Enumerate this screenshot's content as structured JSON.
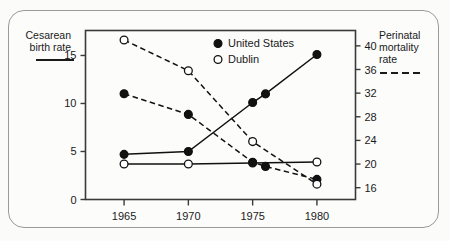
{
  "chart_data": {
    "type": "line",
    "title": "",
    "subtitle": "",
    "x": [
      1965,
      1970,
      1975,
      1976,
      1980
    ],
    "xlabel": "",
    "xtick_labels": [
      "1965",
      "1970",
      "1975",
      "1980"
    ],
    "xticks": [
      1965,
      1970,
      1975,
      1980
    ],
    "xlim": [
      1962,
      1983
    ],
    "left_axis": {
      "label": "Cesarean birth rate",
      "tick_labels": [
        "15",
        "10",
        "5",
        "0"
      ],
      "ticks": [
        15,
        10,
        5,
        0
      ],
      "ylim": [
        0,
        17.6
      ],
      "line_style": "solid"
    },
    "right_axis": {
      "label": "Perinatal mortality rate",
      "tick_labels": [
        "40",
        "36",
        "32",
        "28",
        "24",
        "20",
        "16"
      ],
      "ticks": [
        40,
        36,
        32,
        28,
        24,
        20,
        16
      ],
      "ylim": [
        14,
        42.6
      ],
      "line_style": "dashed"
    },
    "grid": false,
    "legend_position": "top-center",
    "legend": [
      {
        "name": "United States",
        "marker": "filled-circle"
      },
      {
        "name": "Dublin",
        "marker": "open-circle"
      }
    ],
    "series": [
      {
        "name": "United States cesarean birth rate",
        "axis": "left",
        "marker": "filled-circle",
        "line_style": "solid",
        "points": [
          {
            "x": 1965,
            "y": 4.7
          },
          {
            "x": 1970,
            "y": 5.0
          },
          {
            "x": 1975,
            "y": 10.1
          },
          {
            "x": 1976,
            "y": 11.0
          },
          {
            "x": 1980,
            "y": 15.1
          }
        ]
      },
      {
        "name": "Dublin cesarean birth rate",
        "axis": "left",
        "marker": "open-circle",
        "line_style": "solid",
        "points": [
          {
            "x": 1965,
            "y": 3.7
          },
          {
            "x": 1970,
            "y": 3.7
          },
          {
            "x": 1975,
            "y": 3.8
          },
          {
            "x": 1980,
            "y": 3.9
          }
        ]
      },
      {
        "name": "United States perinatal mortality rate",
        "axis": "right",
        "marker": "filled-circle",
        "line_style": "dashed",
        "points": [
          {
            "x": 1965,
            "y": 31.9
          },
          {
            "x": 1970,
            "y": 28.4
          },
          {
            "x": 1975,
            "y": 20.3
          },
          {
            "x": 1976,
            "y": 19.6
          },
          {
            "x": 1980,
            "y": 17.4
          }
        ]
      },
      {
        "name": "Dublin perinatal mortality rate",
        "axis": "right",
        "marker": "open-circle",
        "line_style": "dashed",
        "points": [
          {
            "x": 1965,
            "y": 41.0
          },
          {
            "x": 1970,
            "y": 35.8
          },
          {
            "x": 1975,
            "y": 23.8
          },
          {
            "x": 1980,
            "y": 16.6
          }
        ]
      }
    ]
  },
  "colors": {
    "ink": "#1a1a1a",
    "frame": "#3a3a3a",
    "outer_border": "#9a9a9a",
    "background": "#fcfcfb",
    "marker_fill": "#111111",
    "marker_open": "#ffffff"
  }
}
